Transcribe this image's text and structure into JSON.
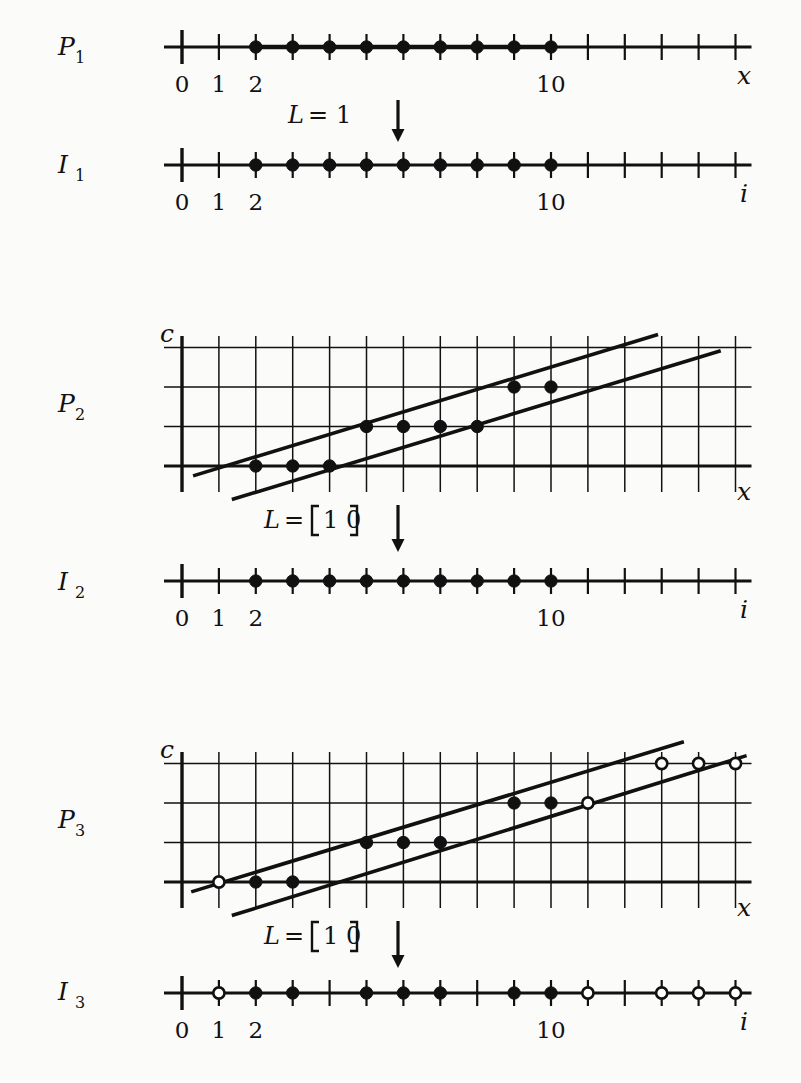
{
  "figure": {
    "background": "#fbfbfa",
    "ink": "#111111"
  },
  "geometry": {
    "x0": 182,
    "dx": 36.9,
    "tick_min": 0,
    "tick_max": 15,
    "tick_half": 11,
    "row_dy": 39.5,
    "dot_r": 6.2
  },
  "panels": [
    {
      "id": "P1",
      "kind": "numberline",
      "label": "P",
      "label_sub": "1",
      "label_x": 58,
      "label_y": 55,
      "axis_y": 47,
      "axis_name": "x",
      "axis_name_x": 737,
      "axis_name_y": 84,
      "tick_labels": [
        {
          "text": "0",
          "index": 0
        },
        {
          "text": "1",
          "index": 1
        },
        {
          "text": "2",
          "index": 2
        },
        {
          "text": "10",
          "index": 10
        }
      ],
      "tick_label_y": 92,
      "bold_span": {
        "from": 2,
        "to": 10
      },
      "points": [
        {
          "i": 2,
          "style": "filled"
        },
        {
          "i": 3,
          "style": "filled"
        },
        {
          "i": 4,
          "style": "filled"
        },
        {
          "i": 5,
          "style": "filled"
        },
        {
          "i": 6,
          "style": "filled"
        },
        {
          "i": 7,
          "style": "filled"
        },
        {
          "i": 8,
          "style": "filled"
        },
        {
          "i": 9,
          "style": "filled"
        },
        {
          "i": 10,
          "style": "filled"
        }
      ]
    },
    {
      "id": "I1",
      "kind": "numberline",
      "label": "I",
      "label_sub": "1",
      "label_x": 58,
      "label_y": 173,
      "axis_y": 165,
      "axis_name": "i",
      "axis_name_x": 740,
      "axis_name_y": 202,
      "tick_labels": [
        {
          "text": "0",
          "index": 0
        },
        {
          "text": "1",
          "index": 1
        },
        {
          "text": "2",
          "index": 2
        },
        {
          "text": "10",
          "index": 10
        }
      ],
      "tick_label_y": 210,
      "bold_span": null,
      "points": [
        {
          "i": 2,
          "style": "filled"
        },
        {
          "i": 3,
          "style": "filled"
        },
        {
          "i": 4,
          "style": "filled"
        },
        {
          "i": 5,
          "style": "filled"
        },
        {
          "i": 6,
          "style": "filled"
        },
        {
          "i": 7,
          "style": "filled"
        },
        {
          "i": 8,
          "style": "filled"
        },
        {
          "i": 9,
          "style": "filled"
        },
        {
          "i": 10,
          "style": "filled"
        }
      ]
    },
    {
      "id": "P2",
      "kind": "grid",
      "label": "P",
      "label_sub": "2",
      "label_x": 58,
      "label_y": 412,
      "c_label": "c",
      "c_label_x": 174,
      "c_label_y": 342,
      "axis_name": "x",
      "axis_name_x": 737,
      "axis_name_y": 500,
      "grid_top": 348,
      "grid_rows": 4,
      "baseline_y": 466,
      "c_axis_top": 336,
      "c_axis_bottom": 492,
      "vgrid_from": 0,
      "vgrid_to": 15,
      "vgrid_top": 336,
      "vgrid_bottom": 492,
      "lines": [
        {
          "name": "upper-bound",
          "x_from": 0.3,
          "c_from": -0.25,
          "x_to": 12.9,
          "c_to": 3.33
        },
        {
          "name": "lower-bound",
          "x_from": 1.35,
          "c_from": -0.85,
          "x_to": 14.6,
          "c_to": 2.92
        }
      ],
      "points": [
        {
          "x": 2,
          "row": 0,
          "style": "filled"
        },
        {
          "x": 3,
          "row": 0,
          "style": "filled"
        },
        {
          "x": 4,
          "row": 0,
          "style": "filled"
        },
        {
          "x": 5,
          "row": 1,
          "style": "filled"
        },
        {
          "x": 6,
          "row": 1,
          "style": "filled"
        },
        {
          "x": 7,
          "row": 1,
          "style": "filled"
        },
        {
          "x": 8,
          "row": 1,
          "style": "filled"
        },
        {
          "x": 9,
          "row": 2,
          "style": "filled"
        },
        {
          "x": 10,
          "row": 2,
          "style": "filled"
        }
      ]
    },
    {
      "id": "I2",
      "kind": "numberline",
      "label": "I",
      "label_sub": "2",
      "label_x": 58,
      "label_y": 590,
      "axis_y": 581,
      "axis_name": "i",
      "axis_name_x": 740,
      "axis_name_y": 618,
      "tick_labels": [
        {
          "text": "0",
          "index": 0
        },
        {
          "text": "1",
          "index": 1
        },
        {
          "text": "2",
          "index": 2
        },
        {
          "text": "10",
          "index": 10
        }
      ],
      "tick_label_y": 626,
      "bold_span": null,
      "points": [
        {
          "i": 2,
          "style": "filled"
        },
        {
          "i": 3,
          "style": "filled"
        },
        {
          "i": 4,
          "style": "filled"
        },
        {
          "i": 5,
          "style": "filled"
        },
        {
          "i": 6,
          "style": "filled"
        },
        {
          "i": 7,
          "style": "filled"
        },
        {
          "i": 8,
          "style": "filled"
        },
        {
          "i": 9,
          "style": "filled"
        },
        {
          "i": 10,
          "style": "filled"
        }
      ]
    },
    {
      "id": "P3",
      "kind": "grid",
      "label": "P",
      "label_sub": "3",
      "label_x": 58,
      "label_y": 828,
      "c_label": "c",
      "c_label_x": 174,
      "c_label_y": 758,
      "axis_name": "x",
      "axis_name_x": 737,
      "axis_name_y": 916,
      "grid_top": 764,
      "grid_rows": 4,
      "baseline_y": 882,
      "c_axis_top": 752,
      "c_axis_bottom": 908,
      "vgrid_from": 0,
      "vgrid_to": 15,
      "vgrid_top": 752,
      "vgrid_bottom": 908,
      "lines": [
        {
          "name": "upper-bound",
          "x_from": 0.25,
          "c_from": -0.25,
          "x_to": 13.6,
          "c_to": 3.55
        },
        {
          "name": "lower-bound",
          "x_from": 1.35,
          "c_from": -0.85,
          "x_to": 15.3,
          "c_to": 3.2
        }
      ],
      "points": [
        {
          "x": 1,
          "row": 0,
          "style": "open"
        },
        {
          "x": 2,
          "row": 0,
          "style": "filled"
        },
        {
          "x": 3,
          "row": 0,
          "style": "filled"
        },
        {
          "x": 5,
          "row": 1,
          "style": "filled"
        },
        {
          "x": 6,
          "row": 1,
          "style": "filled"
        },
        {
          "x": 7,
          "row": 1,
          "style": "filled"
        },
        {
          "x": 9,
          "row": 2,
          "style": "filled"
        },
        {
          "x": 10,
          "row": 2,
          "style": "filled"
        },
        {
          "x": 11,
          "row": 2,
          "style": "open"
        },
        {
          "x": 13,
          "row": 3,
          "style": "open"
        },
        {
          "x": 14,
          "row": 3,
          "style": "open"
        },
        {
          "x": 15,
          "row": 3,
          "style": "open"
        }
      ]
    },
    {
      "id": "I3",
      "kind": "numberline",
      "label": "I",
      "label_sub": "3",
      "label_x": 58,
      "label_y": 1000,
      "axis_y": 993,
      "axis_name": "i",
      "axis_name_x": 740,
      "axis_name_y": 1030,
      "tick_labels": [
        {
          "text": "0",
          "index": 0
        },
        {
          "text": "1",
          "index": 1
        },
        {
          "text": "2",
          "index": 2
        },
        {
          "text": "10",
          "index": 10
        }
      ],
      "tick_label_y": 1038,
      "bold_span": null,
      "points": [
        {
          "i": 1,
          "style": "open"
        },
        {
          "i": 2,
          "style": "filled"
        },
        {
          "i": 3,
          "style": "filled"
        },
        {
          "i": 5,
          "style": "filled"
        },
        {
          "i": 6,
          "style": "filled"
        },
        {
          "i": 7,
          "style": "filled"
        },
        {
          "i": 9,
          "style": "filled"
        },
        {
          "i": 10,
          "style": "filled"
        },
        {
          "i": 11,
          "style": "open"
        },
        {
          "i": 13,
          "style": "open"
        },
        {
          "i": 14,
          "style": "open"
        },
        {
          "i": 15,
          "style": "open"
        }
      ]
    }
  ],
  "transforms": [
    {
      "id": "T1",
      "text_lhs": "L",
      "text_eq": "=",
      "text_rhs": "1",
      "bracketed": false,
      "full_text": "L = 1",
      "text_x": 288,
      "text_y": 123,
      "arrow_x": 398,
      "arrow_y_from": 100,
      "arrow_y_to": 142
    },
    {
      "id": "T2",
      "text_lhs": "L",
      "text_eq": "=",
      "text_rhs": "[1 0]",
      "bracketed": true,
      "full_text": "L = [1 0]",
      "text_x": 264,
      "text_y": 528,
      "arrow_x": 398,
      "arrow_y_from": 505,
      "arrow_y_to": 552
    },
    {
      "id": "T3",
      "text_lhs": "L",
      "text_eq": "=",
      "text_rhs": "[1 0]",
      "bracketed": true,
      "full_text": "L = [1 0]",
      "text_x": 264,
      "text_y": 944,
      "arrow_x": 398,
      "arrow_y_from": 921,
      "arrow_y_to": 968
    }
  ],
  "legend_meaning": {
    "filled_dot": "point in iteration domain",
    "open_dot": "point outside / newly exposed boundary point"
  },
  "chart_data": {
    "type": "scatter",
    "xlabel": "x",
    "ylabel": "c",
    "xlim": [
      0,
      15
    ],
    "ylim": [
      0,
      3
    ],
    "grid": true,
    "legend": "none",
    "series": [
      {
        "name": "P1 domain points",
        "x": [
          2,
          3,
          4,
          5,
          6,
          7,
          8,
          9,
          10
        ],
        "y": [
          0,
          0,
          0,
          0,
          0,
          0,
          0,
          0,
          0
        ],
        "marker": "filled"
      },
      {
        "name": "I1 iteration points",
        "x": [
          2,
          3,
          4,
          5,
          6,
          7,
          8,
          9,
          10
        ],
        "y": [
          0,
          0,
          0,
          0,
          0,
          0,
          0,
          0,
          0
        ],
        "marker": "filled"
      },
      {
        "name": "P2 domain points",
        "x": [
          2,
          3,
          4,
          5,
          6,
          7,
          8,
          9,
          10
        ],
        "y": [
          0,
          0,
          0,
          1,
          1,
          1,
          1,
          2,
          2
        ],
        "marker": "filled"
      },
      {
        "name": "I2 iteration points",
        "x": [
          2,
          3,
          4,
          5,
          6,
          7,
          8,
          9,
          10
        ],
        "y": [
          0,
          0,
          0,
          0,
          0,
          0,
          0,
          0,
          0
        ],
        "marker": "filled"
      },
      {
        "name": "P3 domain points (filled)",
        "x": [
          2,
          3,
          5,
          6,
          7,
          9,
          10
        ],
        "y": [
          0,
          0,
          1,
          1,
          1,
          2,
          2
        ],
        "marker": "filled"
      },
      {
        "name": "P3 boundary points (open)",
        "x": [
          1,
          11,
          13,
          14,
          15
        ],
        "y": [
          0,
          2,
          3,
          3,
          3
        ],
        "marker": "open"
      },
      {
        "name": "I3 iteration points (filled)",
        "x": [
          2,
          3,
          5,
          6,
          7,
          9,
          10
        ],
        "y": [
          0,
          0,
          0,
          0,
          0,
          0,
          0
        ],
        "marker": "filled"
      },
      {
        "name": "I3 boundary points (open)",
        "x": [
          1,
          11,
          13,
          14,
          15
        ],
        "y": [
          0,
          0,
          0,
          0,
          0
        ],
        "marker": "open"
      }
    ],
    "annotations": [
      "L = 1",
      "L = [1 0]",
      "L = [1 0]"
    ]
  }
}
